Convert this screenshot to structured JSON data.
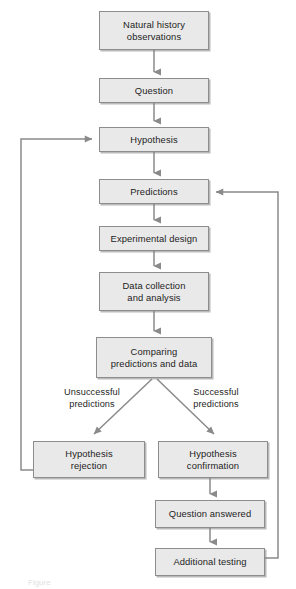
{
  "figure": {
    "kind": "flowchart",
    "width": 296,
    "height": 589,
    "background_color": "#ffffff",
    "node_fill_color": "#e9e9e9",
    "node_border_color": "#8d8d8d",
    "edge_color": "#8a8a8a",
    "text_color": "#1d1d1d",
    "caption_fragment": "Figure"
  },
  "nodes": [
    {
      "id": "natural-history-observations",
      "label": "Natural history\nobservations",
      "x": 99,
      "y": 11,
      "w": 110,
      "h": 39
    },
    {
      "id": "question",
      "label": "Question",
      "x": 99,
      "y": 78,
      "w": 110,
      "h": 25
    },
    {
      "id": "hypothesis",
      "label": "Hypothesis",
      "x": 99,
      "y": 127,
      "w": 110,
      "h": 25
    },
    {
      "id": "predictions",
      "label": "Predictions",
      "x": 99,
      "y": 179,
      "w": 110,
      "h": 25
    },
    {
      "id": "experimental-design",
      "label": "Experimental design",
      "x": 99,
      "y": 226,
      "w": 110,
      "h": 25
    },
    {
      "id": "data-collection-and-analysis",
      "label": "Data collection\nand analysis",
      "x": 99,
      "y": 272,
      "w": 110,
      "h": 39
    },
    {
      "id": "comparing-predictions-and-data",
      "label": "Comparing\npredictions and data",
      "x": 96,
      "y": 337,
      "w": 116,
      "h": 41
    },
    {
      "id": "hypothesis-rejection",
      "label": "Hypothesis\nrejection",
      "x": 33,
      "y": 441,
      "w": 112,
      "h": 37
    },
    {
      "id": "hypothesis-confirmation",
      "label": "Hypothesis\nconfirmation",
      "x": 158,
      "y": 441,
      "w": 110,
      "h": 37
    },
    {
      "id": "question-answered",
      "label": "Question answered",
      "x": 155,
      "y": 500,
      "w": 110,
      "h": 28
    },
    {
      "id": "additional-testing",
      "label": "Additional testing",
      "x": 155,
      "y": 548,
      "w": 110,
      "h": 28
    }
  ],
  "edge_labels": [
    {
      "id": "unsuccessful-predictions",
      "label": "Unsuccessful\npredictions",
      "x": 44,
      "y": 386,
      "w": 96
    },
    {
      "id": "successful-predictions",
      "label": "Successful\npredictions",
      "x": 168,
      "y": 386,
      "w": 96
    }
  ],
  "edges": [
    {
      "id": "observations-to-question",
      "from": "natural-history-observations",
      "to": "question",
      "type": "straight-down"
    },
    {
      "id": "question-to-hypothesis",
      "from": "question",
      "to": "hypothesis",
      "type": "straight-down"
    },
    {
      "id": "hypothesis-to-predictions",
      "from": "hypothesis",
      "to": "predictions",
      "type": "straight-down"
    },
    {
      "id": "predictions-to-experimental-design",
      "from": "predictions",
      "to": "experimental-design",
      "type": "straight-down"
    },
    {
      "id": "experimental-design-to-data",
      "from": "experimental-design",
      "to": "data-collection-and-analysis",
      "type": "straight-down"
    },
    {
      "id": "data-to-comparing",
      "from": "data-collection-and-analysis",
      "to": "comparing-predictions-and-data",
      "type": "straight-down"
    },
    {
      "id": "comparing-to-rejection",
      "from": "comparing-predictions-and-data",
      "to": "hypothesis-rejection",
      "type": "diagonal-left",
      "label": "Unsuccessful predictions"
    },
    {
      "id": "comparing-to-confirmation",
      "from": "comparing-predictions-and-data",
      "to": "hypothesis-confirmation",
      "type": "diagonal-right",
      "label": "Successful predictions"
    },
    {
      "id": "confirmation-to-question-answered",
      "from": "hypothesis-confirmation",
      "to": "question-answered",
      "type": "straight-down"
    },
    {
      "id": "question-answered-to-additional",
      "from": "question-answered",
      "to": "additional-testing",
      "type": "straight-down"
    },
    {
      "id": "rejection-feedback-to-hypothesis",
      "from": "hypothesis-rejection",
      "to": "hypothesis",
      "type": "loop-left"
    },
    {
      "id": "additional-testing-feedback-to-predictions",
      "from": "additional-testing",
      "to": "predictions",
      "type": "loop-right"
    }
  ]
}
